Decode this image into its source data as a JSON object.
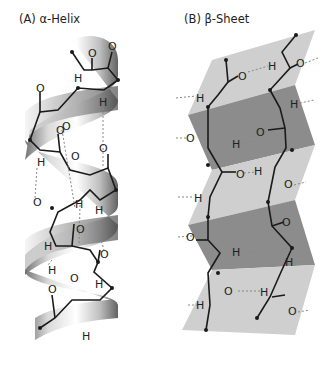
{
  "panels": [
    {
      "id": "A",
      "title": "(A) α-Helix"
    },
    {
      "id": "B",
      "title": "(B) β-Sheet"
    }
  ],
  "atoms": {
    "oxygen": "O",
    "hydrogen": "H"
  },
  "colors": {
    "ribbon_light": "#e6e6e6",
    "ribbon_dark": "#7a7a7a",
    "sheet_light": "#c9c9c9",
    "sheet_dark": "#8f8f8f",
    "bond": "#1a1a1a",
    "hbond": "#888888"
  }
}
